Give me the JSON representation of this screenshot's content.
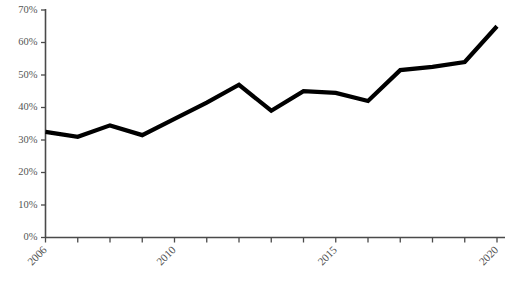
{
  "chart_data": {
    "type": "line",
    "title": "",
    "subtitle": "",
    "xlabel": "",
    "ylabel": "",
    "x": [
      2006,
      2007,
      2008,
      2009,
      2010,
      2011,
      2012,
      2013,
      2014,
      2015,
      2016,
      2017,
      2018,
      2019,
      2020
    ],
    "categories": [
      "2006",
      "2007",
      "2008",
      "2009",
      "2010",
      "2011",
      "2012",
      "2013",
      "2014",
      "2015",
      "2016",
      "2017",
      "2018",
      "2019",
      "2020"
    ],
    "values": [
      32.5,
      31.0,
      34.5,
      31.5,
      36.5,
      41.5,
      47.0,
      39.0,
      45.0,
      44.5,
      42.0,
      51.5,
      52.5,
      54.0,
      65.0
    ],
    "series": [
      {
        "name": "Series 1",
        "color": "#000000",
        "values": [
          32.5,
          31.0,
          34.5,
          31.5,
          36.5,
          41.5,
          47.0,
          39.0,
          45.0,
          44.5,
          42.0,
          51.5,
          52.5,
          54.0,
          65.0
        ]
      }
    ],
    "xlim": [
      2006,
      2020
    ],
    "ylim": [
      0,
      70
    ],
    "y_ticks": [
      0,
      10,
      20,
      30,
      40,
      50,
      60,
      70
    ],
    "y_tick_labels": [
      "0%",
      "10%",
      "20%",
      "30%",
      "40%",
      "50%",
      "60%",
      "70%"
    ],
    "x_ticks": [
      2006,
      2007,
      2008,
      2009,
      2010,
      2011,
      2012,
      2013,
      2014,
      2015,
      2016,
      2017,
      2018,
      2019,
      2020
    ],
    "x_tick_labels_visible": [
      "2006",
      "2010",
      "2015",
      "2020"
    ],
    "x_tick_label_rotation": "45",
    "grid": "off",
    "legend": "none",
    "legend_position": "none",
    "line_color": "#000000",
    "axis_color": "#4a4a4a",
    "background_color": "#ffffff",
    "annotations": []
  }
}
